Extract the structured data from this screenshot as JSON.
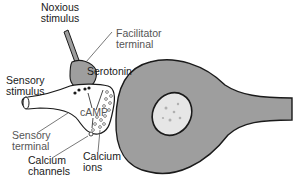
{
  "diagram": {
    "labels": {
      "noxious_stimulus": [
        "Noxious",
        "stimulus"
      ],
      "facilitator_terminal": [
        "Facilitator",
        "terminal"
      ],
      "serotonin": "Serotonin",
      "sensory_stimulus": [
        "Sensory",
        "stimulus"
      ],
      "camp": "cAMP",
      "sensory_terminal": [
        "Sensory",
        "terminal"
      ],
      "calcium_channels": [
        "Calcium",
        "channels"
      ],
      "calcium_ions": [
        "Calcium",
        "ions"
      ]
    },
    "colors": {
      "cell_fill": "#9e9e9e",
      "outline": "#1a1a1a",
      "nucleus_fill": "#e6e6e6",
      "label_text": "#2a2a2a",
      "grey_label_text": "#555555"
    }
  }
}
